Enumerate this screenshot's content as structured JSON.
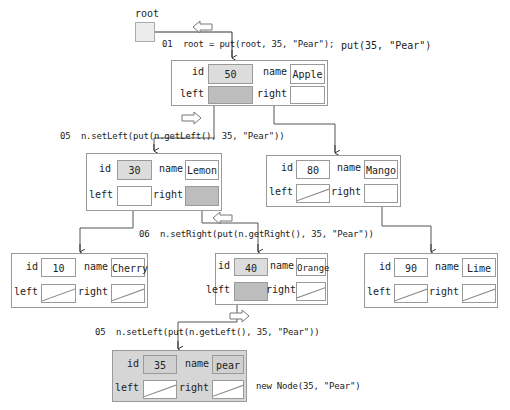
{
  "root": {
    "label": "root"
  },
  "title_call": "put(35, \"Pear\")",
  "code_lines": [
    {
      "num": "01",
      "text": "root = put(root, 35, \"Pear\");"
    },
    {
      "num": "05",
      "text": "n.setLeft(put(n.getLeft(), 35, \"Pear\"))"
    },
    {
      "num": "06",
      "text": "n.setRight(put(n.getRight(), 35, \"Pear\"))"
    },
    {
      "num": "05",
      "text": "n.setLeft(put(n.getLeft(), 35, \"Pear\"))"
    }
  ],
  "new_node_caption": "new Node(35, \"Pear\")",
  "field_labels": {
    "id": "id",
    "name": "name",
    "left": "left",
    "right": "right"
  },
  "nodes": {
    "n50": {
      "id": "50",
      "name": "Apple"
    },
    "n30": {
      "id": "30",
      "name": "Lemon"
    },
    "n80": {
      "id": "80",
      "name": "Mango"
    },
    "n10": {
      "id": "10",
      "name": "Cherry"
    },
    "n40": {
      "id": "40",
      "name": "Orange"
    },
    "n90": {
      "id": "90",
      "name": "Lime"
    },
    "n35": {
      "id": "35",
      "name": "pear"
    }
  },
  "colors": {
    "border": "#9a9a9a",
    "highlight_id": "#dcdcdc",
    "highlight_pointer": "#bdbdbd",
    "new_node_bg": "#d6d6d6"
  }
}
